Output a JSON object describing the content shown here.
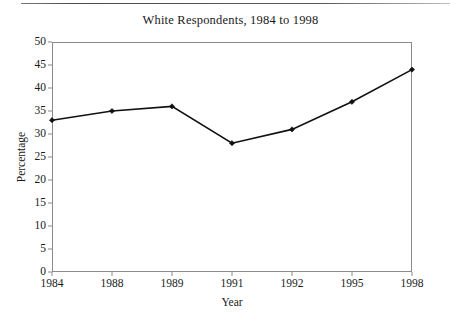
{
  "page": {
    "rule_visible": true
  },
  "figure": {
    "title": "White Respondents, 1984 to 1998"
  },
  "chart_data": {
    "type": "line",
    "title": "White Respondents, 1984 to 1998",
    "xlabel": "Year",
    "ylabel": "Percentage",
    "categories": [
      "1984",
      "1988",
      "1989",
      "1991",
      "1992",
      "1995",
      "1998"
    ],
    "values": [
      33,
      35,
      36,
      28,
      31,
      37,
      44
    ],
    "series": [
      {
        "name": "White Respondents",
        "values": [
          33,
          35,
          36,
          28,
          31,
          37,
          44
        ]
      }
    ],
    "ylim": [
      0,
      50
    ],
    "ytick_step": 5,
    "yticks": [
      0,
      5,
      10,
      15,
      20,
      25,
      30,
      35,
      40,
      45,
      50
    ],
    "ytick_labels": [
      "0",
      "5",
      "10",
      "15",
      "20",
      "25",
      "30",
      "35",
      "40",
      "45",
      "50"
    ],
    "grid": false,
    "legend": null,
    "marker": "diamond",
    "line_color": "#111111",
    "frame_color": "#8a8a8a",
    "axis_scale": "categorical"
  }
}
